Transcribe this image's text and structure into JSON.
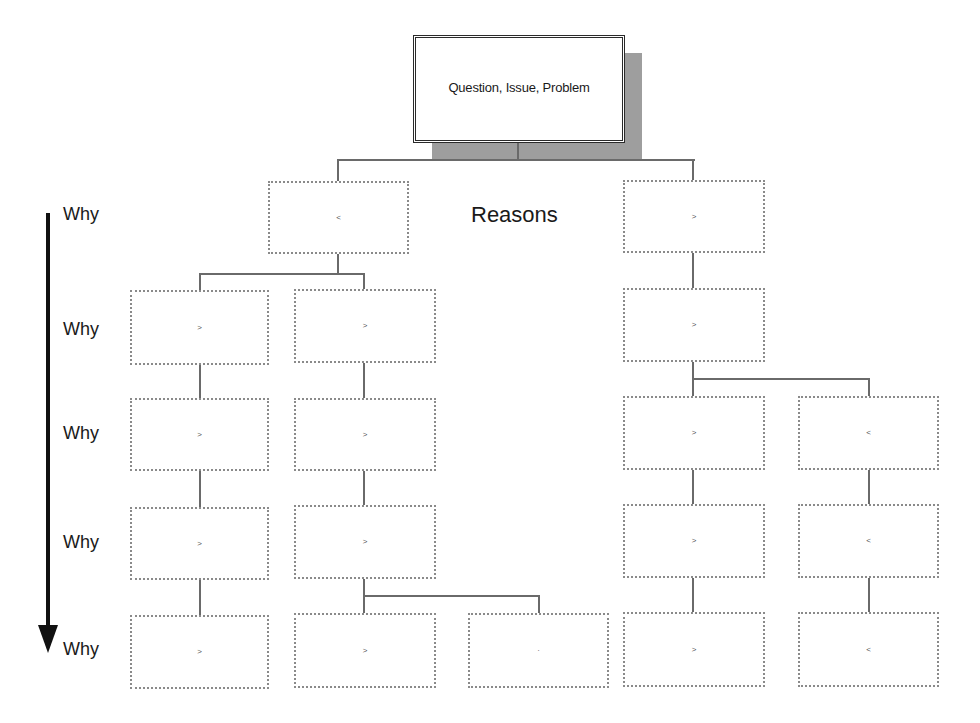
{
  "diagram": {
    "root": {
      "label": "Question, Issue, Problem"
    },
    "section_label": "Reasons",
    "axis": {
      "direction": "down",
      "labels": [
        "Why",
        "Why",
        "Why",
        "Why",
        "Why"
      ]
    },
    "boxes": [
      {
        "id": "r1",
        "label": "",
        "mark": "˂"
      },
      {
        "id": "r2",
        "label": "",
        "mark": "˃"
      },
      {
        "id": "a2",
        "label": "",
        "mark": "˃"
      },
      {
        "id": "b2",
        "label": "",
        "mark": "˃"
      },
      {
        "id": "d2",
        "label": "",
        "mark": "˃"
      },
      {
        "id": "a3",
        "label": "",
        "mark": "˃"
      },
      {
        "id": "b3",
        "label": "",
        "mark": "˃"
      },
      {
        "id": "d3",
        "label": "",
        "mark": "˃"
      },
      {
        "id": "e3",
        "label": "",
        "mark": "˂"
      },
      {
        "id": "a4",
        "label": "",
        "mark": "˃"
      },
      {
        "id": "b4",
        "label": "",
        "mark": "˃"
      },
      {
        "id": "d4",
        "label": "",
        "mark": "˃"
      },
      {
        "id": "e4",
        "label": "",
        "mark": "˂"
      },
      {
        "id": "a5",
        "label": "",
        "mark": "˃"
      },
      {
        "id": "b5",
        "label": "",
        "mark": "˃"
      },
      {
        "id": "c5",
        "label": "",
        "mark": "·"
      },
      {
        "id": "d5",
        "label": "",
        "mark": "˃"
      },
      {
        "id": "e5",
        "label": "",
        "mark": "˂"
      }
    ],
    "colors": {
      "shadow": "#9e9e9e",
      "connector": "#6a6a6a",
      "dotted_border": "#8a8a8a",
      "arrow": "#111111"
    }
  }
}
